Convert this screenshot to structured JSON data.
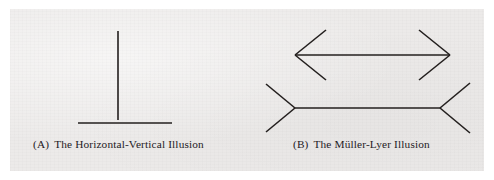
{
  "figure": {
    "background_color": "#ffffff",
    "plate_color": "#eceae9",
    "ink_color": "#231f1e",
    "stroke_width": 1.6,
    "panels": [
      {
        "id": "panel-a",
        "tag": "(A)",
        "caption": "The Horizontal-Vertical Illusion",
        "illusion_name": "Horizontal-Vertical Illusion",
        "caption_full": "(A)  The Horizontal-Vertical Illusion",
        "shape": "inverted-T",
        "segments": [
          {
            "name": "vertical-line",
            "x1": 118,
            "y1": 31,
            "x2": 118,
            "y2": 120
          },
          {
            "name": "horizontal-line",
            "x1": 78,
            "y1": 123,
            "x2": 172,
            "y2": 123
          }
        ]
      },
      {
        "id": "panel-b",
        "tag": "(B)",
        "caption": "The Müller-Lyer Illusion",
        "illusion_name": "Müller-Lyer Illusion",
        "caption_full": "(B)  The Müller-Lyer Illusion",
        "shape": "two-shafts-with-fins",
        "figures": [
          {
            "name": "outward-fins-figure",
            "fin_direction": "outward",
            "shaft": {
              "x1": 295,
              "y1": 55,
              "x2": 450,
              "y2": 55
            },
            "fins": [
              {
                "name": "fin-top-left",
                "x1": 295,
                "y1": 55,
                "x2": 326,
                "y2": 30
              },
              {
                "name": "fin-bottom-left",
                "x1": 295,
                "y1": 55,
                "x2": 326,
                "y2": 80
              },
              {
                "name": "fin-top-right",
                "x1": 450,
                "y1": 55,
                "x2": 419,
                "y2": 30
              },
              {
                "name": "fin-bottom-right",
                "x1": 450,
                "y1": 55,
                "x2": 419,
                "y2": 80
              }
            ]
          },
          {
            "name": "inward-fins-figure",
            "fin_direction": "inward",
            "shaft": {
              "x1": 295,
              "y1": 108,
              "x2": 440,
              "y2": 108
            },
            "fins": [
              {
                "name": "fin-top-left",
                "x1": 295,
                "y1": 108,
                "x2": 266,
                "y2": 84
              },
              {
                "name": "fin-bottom-left",
                "x1": 295,
                "y1": 108,
                "x2": 266,
                "y2": 132
              },
              {
                "name": "fin-top-right",
                "x1": 440,
                "y1": 108,
                "x2": 470,
                "y2": 83
              },
              {
                "name": "fin-bottom-right",
                "x1": 440,
                "y1": 108,
                "x2": 470,
                "y2": 133
              }
            ]
          }
        ]
      }
    ]
  }
}
